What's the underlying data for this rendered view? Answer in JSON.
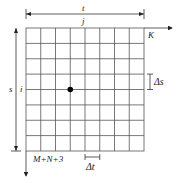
{
  "diagram": {
    "type": "finite-difference-grid",
    "grid": {
      "columns": 8,
      "rows": 8,
      "left": 26,
      "top": 28,
      "right": 144,
      "bottom": 151,
      "line_color": "#555555"
    },
    "labels": {
      "t_axis": "t",
      "j_index": "j",
      "k_label": "K",
      "s_axis": "s",
      "i_index": "i",
      "delta_s": "Δs",
      "delta_t": "Δt",
      "bottom_index": "M+N+3"
    },
    "marked_node": {
      "column": 3,
      "row": 4,
      "color": "#000000"
    }
  }
}
